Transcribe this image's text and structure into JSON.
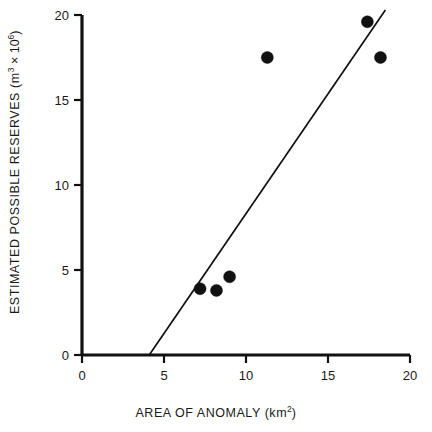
{
  "chart_data": {
    "type": "scatter",
    "title": "",
    "xlabel": "AREA OF ANOMALY (km²)",
    "ylabel": "ESTIMATED POSSIBLE RESERVES (m³ × 10⁶)",
    "xlabel_parts": {
      "main": "AREA OF ANOMALY (km",
      "exponent": "2",
      "tail": ")"
    },
    "ylabel_parts": {
      "main": "ESTIMATED POSSIBLE RESERVES (m",
      "exponent_unit": "3",
      "times": " × 10",
      "exponent_scale": "6",
      "tail": ")"
    },
    "xlim": [
      0,
      20
    ],
    "ylim": [
      0,
      20
    ],
    "xticks": [
      0,
      5,
      10,
      15,
      20
    ],
    "yticks": [
      0,
      5,
      10,
      15,
      20
    ],
    "xtick_labels": [
      "0",
      "5",
      "10",
      "15",
      "20"
    ],
    "ytick_labels": [
      "0",
      "5",
      "10",
      "15",
      "20"
    ],
    "grid": false,
    "legend": false,
    "legend_position": "none",
    "marker": "filled-circle",
    "marker_color": "#111111",
    "marker_radius_px": 6,
    "line_color": "#111111",
    "axis_color": "#111111",
    "background_color": "#ffffff",
    "points": [
      {
        "x": 7.2,
        "y": 3.9
      },
      {
        "x": 8.2,
        "y": 3.8
      },
      {
        "x": 9.0,
        "y": 4.6
      },
      {
        "x": 11.3,
        "y": 17.5
      },
      {
        "x": 17.4,
        "y": 19.6
      },
      {
        "x": 18.2,
        "y": 17.5
      }
    ],
    "series": [
      {
        "name": "observations",
        "x": [
          7.2,
          8.2,
          9.0,
          11.3,
          17.4,
          18.2
        ],
        "values": [
          3.9,
          3.8,
          4.6,
          17.5,
          19.6,
          17.5
        ]
      }
    ],
    "trend_line": {
      "type": "linear-fit",
      "x_start": 4.1,
      "y_start": 0.0,
      "x_end": 18.5,
      "y_end": 20.3
    }
  }
}
